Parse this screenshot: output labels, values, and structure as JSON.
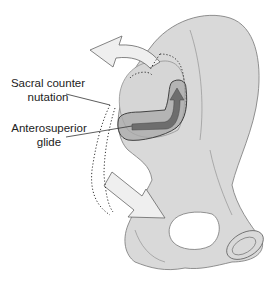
{
  "figure": {
    "labels": {
      "sacral_line1": "Sacral counter",
      "sacral_line2": "nutation",
      "glide_line1": "Anterosuperior",
      "glide_line2": "glide"
    },
    "colors": {
      "bone_fill": "#d9d9d9",
      "bone_stroke": "#777777",
      "arrow_fill": "#eeeeee",
      "glide_band": "#9a9a9a",
      "glide_arrow": "#6e6e6e",
      "dotted": "#333333"
    }
  }
}
